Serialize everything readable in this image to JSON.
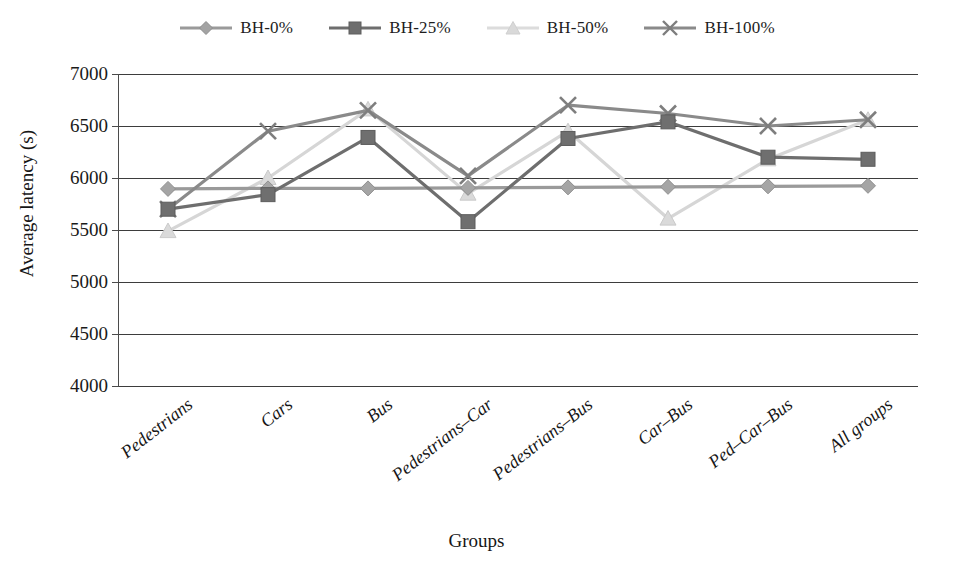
{
  "chart_data": {
    "type": "line",
    "title": "",
    "xlabel": "Groups",
    "ylabel": "Average latency (s)",
    "ylim": [
      4000,
      7000
    ],
    "yticks": [
      4000,
      4500,
      5000,
      5500,
      6000,
      6500,
      7000
    ],
    "grid": true,
    "legend_position": "top-center",
    "categories": [
      "Pedestrians",
      "Cars",
      "Bus",
      "Pedestrians–Car",
      "Pedestrians–Bus",
      "Car–Bus",
      "Ped–Car–Bus",
      "All groups"
    ],
    "series": [
      {
        "name": "BH-0%",
        "marker": "diamond",
        "color": "#9a9a9a",
        "values": [
          5895,
          5900,
          5900,
          5905,
          5910,
          5915,
          5920,
          5925
        ]
      },
      {
        "name": "BH-25%",
        "marker": "square",
        "color": "#6e6e6e",
        "values": [
          5700,
          5840,
          6390,
          5580,
          6380,
          6540,
          6200,
          6180
        ]
      },
      {
        "name": "BH-50%",
        "marker": "triangle",
        "color": "#d6d6d6",
        "values": [
          5490,
          6000,
          6660,
          5850,
          6450,
          5610,
          6180,
          6560
        ]
      },
      {
        "name": "BH-100%",
        "marker": "x",
        "color": "#8a8a8a",
        "values": [
          5700,
          6450,
          6650,
          6020,
          6700,
          6620,
          6500,
          6560
        ]
      }
    ]
  },
  "legend": {
    "items": [
      {
        "label": "BH-0%",
        "marker": "diamond-marker-icon",
        "color": "#9a9a9a"
      },
      {
        "label": "BH-25%",
        "marker": "square-marker-icon",
        "color": "#6e6e6e"
      },
      {
        "label": "BH-50%",
        "marker": "triangle-marker-icon",
        "color": "#d6d6d6"
      },
      {
        "label": "BH-100%",
        "marker": "x-marker-icon",
        "color": "#8a8a8a"
      }
    ]
  },
  "axes": {
    "y_tick_labels": [
      "7000",
      "6500",
      "6000",
      "5500",
      "5000",
      "4500",
      "4000"
    ],
    "y_axis_title": "Average latency (s)",
    "x_axis_title": "Groups",
    "x_tick_labels": [
      "Pedestrians",
      "Cars",
      "Bus",
      "Pedestrians–Car",
      "Pedestrians–Bus",
      "Car–Bus",
      "Ped–Car–Bus",
      "All groups"
    ]
  }
}
